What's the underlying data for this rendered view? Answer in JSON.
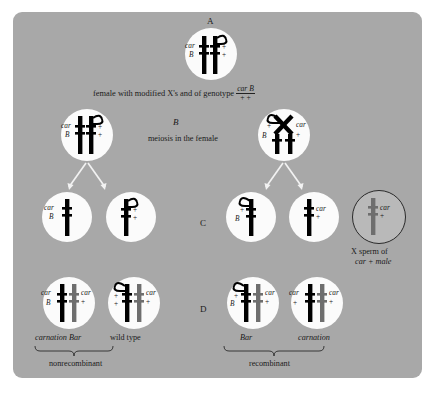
{
  "figure": {
    "background_color": "#a8a8a8",
    "cell_color": "#fbfbfb",
    "chromosome_maternal_color": "#000000",
    "chromosome_paternal_color": "#6e6e6e"
  },
  "rows": {
    "a": {
      "letter": "A",
      "caption_prefix": "female with modified X's and of genotype",
      "genotype_numerator": "car B",
      "genotype_denominator": "+  +",
      "cell": {
        "name": "oocyte-cell",
        "genes_left": [
          "car",
          "B"
        ],
        "genes_right": [
          "+",
          "+"
        ]
      }
    },
    "b": {
      "letter": "B",
      "caption": "meiosis in the female",
      "cells": [
        {
          "name": "meiosis-cell-no-crossover",
          "genes_left": [
            "car",
            "B"
          ],
          "genes_right": [
            "+",
            "+"
          ]
        },
        {
          "name": "meiosis-cell-crossover",
          "genes_left": [
            "+",
            "B"
          ],
          "genes_right": [
            "car",
            "+"
          ]
        }
      ]
    },
    "c": {
      "letter": "C",
      "cells": [
        {
          "name": "egg-cell-car-B",
          "genes_left": [
            "car",
            "B"
          ],
          "genes_right": []
        },
        {
          "name": "egg-cell-plus-plus",
          "genes_left": [],
          "genes_right": [
            "+",
            "+"
          ]
        },
        {
          "name": "egg-cell-plus-B",
          "genes_left": [
            "+",
            "B"
          ],
          "genes_right": []
        },
        {
          "name": "egg-cell-car-plus",
          "genes_left": [],
          "genes_right": [
            "car",
            "+"
          ]
        }
      ],
      "sperm": {
        "name": "x-sperm-cell",
        "genes_right": [
          "car",
          "+"
        ],
        "caption_line1": "X sperm of",
        "caption_line2": "car + male"
      }
    },
    "d": {
      "letter": "D",
      "cells": [
        {
          "name": "zygote-carnation-bar",
          "label": "carnation Bar",
          "genes_left": [
            "car",
            "B"
          ],
          "genes_right": [
            "car",
            "+"
          ]
        },
        {
          "name": "zygote-wild-type",
          "label": "wild type",
          "genes_left": [
            "+",
            "+"
          ],
          "genes_right": [
            "car",
            "+"
          ]
        },
        {
          "name": "zygote-bar",
          "label": "Bar",
          "genes_left": [
            "+",
            "B"
          ],
          "genes_right": [
            "car",
            "+"
          ]
        },
        {
          "name": "zygote-carnation",
          "label": "carnation",
          "genes_left": [
            "car",
            "+"
          ],
          "genes_right": [
            "car",
            "+"
          ]
        }
      ]
    },
    "brackets": [
      {
        "name": "bracket-nonrecombinant",
        "label": "nonrecombinant"
      },
      {
        "name": "bracket-recombinant",
        "label": "recombinant"
      }
    ]
  }
}
